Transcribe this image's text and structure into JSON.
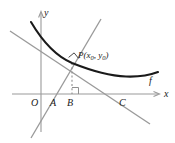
{
  "figure": {
    "background_color": "#ffffff",
    "width": 175,
    "height": 143,
    "axes": {
      "x_axis_label": "x",
      "y_axis_label": "y",
      "origin_label": "O",
      "axis_color": "#9a9a9a",
      "arrow_style": "open"
    },
    "points": [
      {
        "id": "O",
        "label": "O",
        "x": 38,
        "y": 94,
        "label_x": 33,
        "label_y": 105
      },
      {
        "id": "A",
        "label": "A",
        "x": 55,
        "y": 94,
        "label_x": 51,
        "label_y": 105
      },
      {
        "id": "B",
        "label": "B",
        "x": 72,
        "y": 94,
        "label_x": 68,
        "label_y": 105
      },
      {
        "id": "C",
        "label": "C",
        "x": 125,
        "y": 94,
        "label_x": 120,
        "label_y": 105
      },
      {
        "id": "P",
        "label": "P",
        "x": 72,
        "y": 62,
        "label_x": 79,
        "label_y": 58
      }
    ],
    "point_label": {
      "name": "P",
      "open_paren": "(",
      "x_var": "x",
      "x_sub": "0",
      "comma": ", ",
      "y_var": "y",
      "y_sub": "0",
      "close_paren": ")",
      "full_text": "P(x0, y0)"
    },
    "curve": {
      "name": "f",
      "label": "f",
      "label_x": 151,
      "label_y": 80,
      "color": "#1a1a1a",
      "stroke_width": 2.1,
      "description": "convex decreasing-then-increasing curve with minimum near x=125"
    },
    "tangent_line": {
      "name": "tangent",
      "color": "#9a9a9a",
      "stroke_width": 1.3,
      "through": "P",
      "x_intercept": "C",
      "slope": "negative"
    },
    "normal_line": {
      "name": "normal",
      "color": "#9a9a9a",
      "stroke_width": 1.3,
      "through": "P",
      "x_intercept": "A",
      "slope": "positive"
    },
    "dashed_segment": {
      "name": "PB",
      "from": "P",
      "to": "B",
      "color": "#9a9a9a",
      "dash": "2 2"
    },
    "right_angles": [
      {
        "id": "angle-at-B",
        "vertex": "B",
        "between": [
          "PB",
          "x-axis"
        ]
      },
      {
        "id": "angle-at-P",
        "vertex": "P",
        "between": [
          "tangent",
          "normal"
        ]
      }
    ]
  }
}
